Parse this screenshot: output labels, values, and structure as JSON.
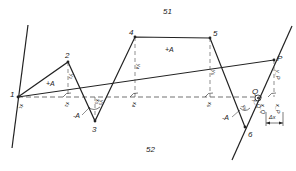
{
  "diagram": {
    "regions": [
      {
        "label": "51",
        "x": 163,
        "y": 14
      },
      {
        "label": "52",
        "x": 146,
        "y": 152
      }
    ],
    "points": [
      {
        "id": "1",
        "label": "1",
        "x": 18,
        "y": 97,
        "lx": 10,
        "ly": 97
      },
      {
        "id": "2",
        "label": "2",
        "x": 68,
        "y": 62,
        "lx": 65,
        "ly": 58
      },
      {
        "id": "3",
        "label": "3",
        "x": 95,
        "y": 121,
        "lx": 92,
        "ly": 132
      },
      {
        "id": "4",
        "label": "4",
        "x": 135,
        "y": 37,
        "lx": 129,
        "ly": 35
      },
      {
        "id": "5",
        "label": "5",
        "x": 210,
        "y": 38,
        "lx": 213,
        "ly": 36
      },
      {
        "id": "6",
        "label": "6",
        "x": 245,
        "y": 127,
        "lx": 248,
        "ly": 137
      },
      {
        "id": "P",
        "label": "P",
        "x": 274,
        "y": 60,
        "lx": 277,
        "ly": 61
      },
      {
        "id": "Q",
        "label": "Q",
        "x": 258,
        "y": 98,
        "lx": 252,
        "ly": 94
      }
    ],
    "areas": [
      {
        "label": "+A",
        "x": 46,
        "y": 86
      },
      {
        "label": "-A",
        "x": 73,
        "y": 118
      },
      {
        "label": "+A",
        "x": 165,
        "y": 52
      },
      {
        "label": "-A",
        "x": 222,
        "y": 120
      }
    ],
    "axis_labels": [
      {
        "label": "x₁",
        "x": 20,
        "y": 108
      },
      {
        "label": "x₂",
        "x": 66,
        "y": 106
      },
      {
        "label": "x₃",
        "x": 98,
        "y": 104
      },
      {
        "label": "x₄",
        "x": 133,
        "y": 106
      },
      {
        "label": "x₅",
        "x": 208,
        "y": 106
      },
      {
        "label": "x_Q",
        "x": 261,
        "y": 110
      },
      {
        "label": "x_P",
        "x": 276,
        "y": 110
      }
    ],
    "y_labels": [
      {
        "label": "y₂",
        "x": 70,
        "y": 80
      },
      {
        "label": "y₃",
        "x": 100,
        "y": 100
      },
      {
        "label": "y₄",
        "x": 137,
        "y": 70
      },
      {
        "label": "y₅",
        "x": 212,
        "y": 76
      },
      {
        "label": "y_P",
        "x": 276,
        "y": 78
      },
      {
        "label": "y_Q",
        "x": 256,
        "y": 110
      },
      {
        "label": "y₆",
        "x": 240,
        "y": 108
      }
    ],
    "delta": {
      "label": "Δx",
      "x": 273,
      "y": 118
    },
    "colors": {
      "stroke": "#222222",
      "background": "#ffffff"
    }
  }
}
